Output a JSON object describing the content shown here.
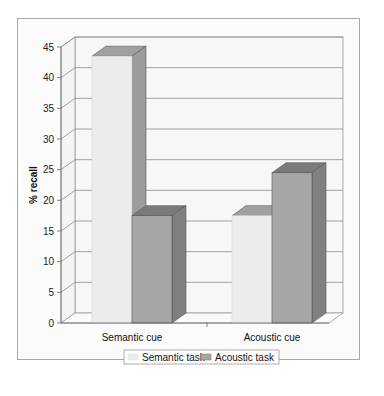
{
  "chart_data": {
    "type": "bar",
    "subtype": "3d-clustered-column",
    "title": "",
    "xlabel": "",
    "ylabel": "% recall",
    "categories": [
      "Semantic cue",
      "Acoustic cue"
    ],
    "series": [
      {
        "name": "Semantic task",
        "values": [
          43.5,
          17.5
        ],
        "color": "#ececec"
      },
      {
        "name": "Acoustic task",
        "values": [
          17.5,
          24.5
        ],
        "color": "#a6a6a6"
      }
    ],
    "ylim": [
      0,
      45
    ],
    "yticks": [
      "0",
      "5",
      "10",
      "15",
      "20",
      "25",
      "30",
      "35",
      "40",
      "45"
    ],
    "grid": true,
    "legend_position": "bottom"
  }
}
